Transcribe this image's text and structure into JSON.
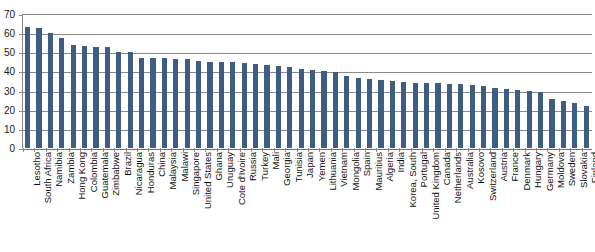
{
  "chart_data": {
    "type": "bar",
    "title": "",
    "xlabel": "",
    "ylabel": "",
    "ylim": [
      0,
      70
    ],
    "yticks": [
      0,
      10,
      20,
      30,
      40,
      50,
      60,
      70
    ],
    "grid": true,
    "legend": null,
    "bar_color": "#3e5d82",
    "categories": [
      "Lesotho",
      "South Africa",
      "Namibia",
      "Zambia",
      "Hong Kong",
      "Colombia",
      "Guatemala",
      "Zimbabwe",
      "Brazil",
      "Nicaragua",
      "Honduras",
      "China",
      "Malaysia",
      "Malawi",
      "Singapore",
      "United States",
      "Ghana",
      "Uruguay",
      "Cote d'Ivoire",
      "Russia",
      "Turkey",
      "Mali",
      "Georgia",
      "Tunisia",
      "Japan",
      "Yemen",
      "Lithuania",
      "Vietnam",
      "Mongolia",
      "Spain",
      "Mauritius",
      "Algeria",
      "India",
      "Korea, South",
      "Portugal",
      "United Kingdom",
      "Canada",
      "Netherlands",
      "Australia",
      "Kosovo",
      "Switzerland",
      "Austria",
      "France",
      "Denmark",
      "Hungary",
      "Germany",
      "Moldova",
      "Sweden",
      "Slovakia",
      "Finland"
    ],
    "values": [
      63.2,
      62.5,
      60.0,
      57.5,
      53.8,
      53.2,
      53.0,
      53.0,
      50.1,
      50.0,
      47.2,
      47.2,
      46.9,
      46.4,
      46.3,
      45.4,
      45.1,
      45.0,
      44.8,
      44.5,
      44.0,
      43.5,
      43.0,
      42.5,
      41.5,
      40.5,
      40.0,
      39.5,
      37.5,
      36.5,
      36.0,
      35.5,
      35.0,
      34.5,
      34.0,
      34.0,
      33.8,
      33.5,
      33.5,
      33.0,
      32.5,
      31.5,
      31.0,
      30.5,
      30.0,
      29.5,
      25.5,
      24.5,
      23.5,
      22.0
    ]
  }
}
